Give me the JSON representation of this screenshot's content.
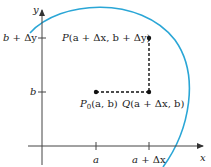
{
  "axes": {
    "x_label": "x",
    "y_label": "y",
    "x_ticks": [
      {
        "label_a": "a",
        "label_rest": ""
      },
      {
        "label_a": "a",
        "label_rest": " + Δx"
      }
    ],
    "y_ticks": [
      {
        "label_b": "b",
        "label_rest": " + Δy"
      },
      {
        "label_b": "b",
        "label_rest": ""
      }
    ]
  },
  "points": {
    "P": {
      "name": "P",
      "coords": "(a + Δx, b + Δy)"
    },
    "P0": {
      "name": "P",
      "sub": "0",
      "coords": "(a, b)"
    },
    "Q": {
      "name": "Q",
      "coords": "(a + Δx, b)"
    }
  },
  "colors": {
    "curve": "#2aa6d6",
    "axis": "#333333",
    "points": "#111111"
  }
}
